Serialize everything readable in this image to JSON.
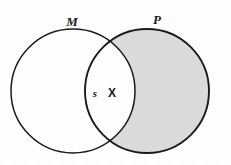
{
  "diagram": {
    "type": "venn-two-set",
    "title": "",
    "background_color": "#ffffff",
    "stroke_color": "#1b1b1b",
    "shading_color": "#dcdcdc",
    "unshaded_color": "#ffffff",
    "width": 231,
    "height": 165,
    "sets": [
      {
        "id": "M",
        "label": "M",
        "label_x": 72,
        "label_y": 26,
        "center_x": 73,
        "center_y": 91,
        "radius": 62,
        "shaded": false,
        "stroke_width": 1.5
      },
      {
        "id": "P",
        "label": "P",
        "label_x": 157,
        "label_y": 24,
        "center_x": 147,
        "center_y": 91,
        "radius": 62,
        "shaded": true,
        "stroke_width": 1.9
      }
    ],
    "regions": [
      {
        "id": "m-only",
        "name": "M-only",
        "shaded": false,
        "fill": "#ffffff"
      },
      {
        "id": "intersection",
        "name": "M-and-P",
        "shaded": false,
        "fill": "#ffffff"
      },
      {
        "id": "p-only",
        "name": "P-only",
        "shaded": true,
        "fill": "#dcdcdc"
      }
    ],
    "annotations": [
      {
        "id": "s-mark",
        "text": "s",
        "style": "italic",
        "x": 95,
        "y": 97,
        "region": "intersection"
      },
      {
        "id": "x-mark",
        "text": "X",
        "style": "upright",
        "x": 112,
        "y": 97,
        "region": "intersection"
      }
    ],
    "intersection_points": [
      {
        "x": 108,
        "y": 48
      },
      {
        "x": 108,
        "y": 135
      }
    ]
  }
}
